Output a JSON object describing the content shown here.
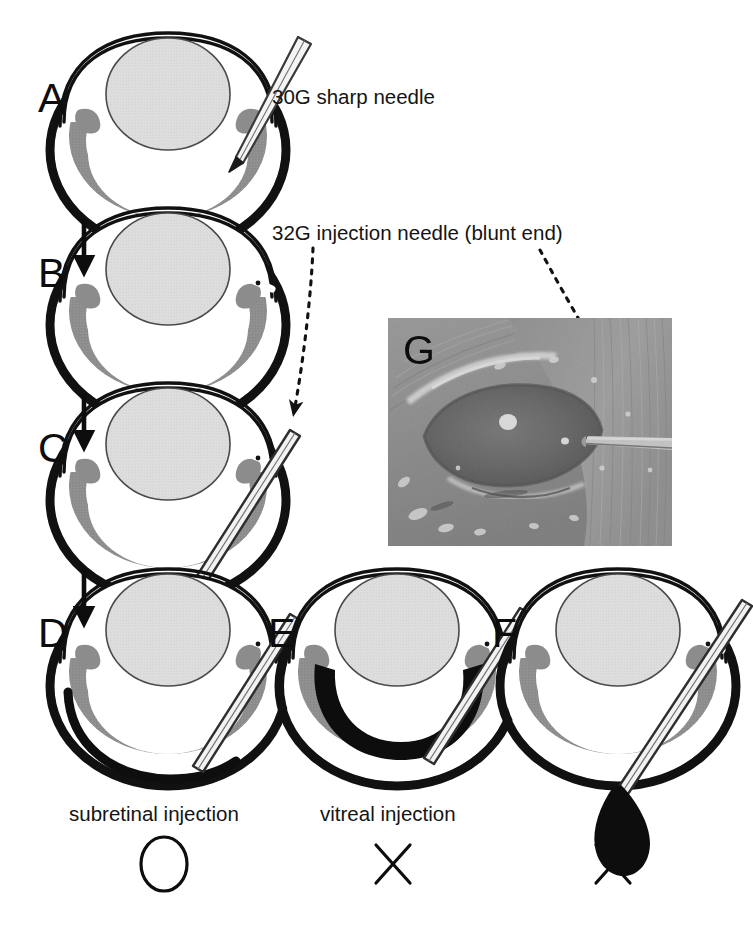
{
  "figure": {
    "background_color": "#ffffff",
    "width": 753,
    "height": 929
  },
  "colors": {
    "sclera_black": "#111111",
    "retina_gray": "#8c8c8c",
    "lens_gray": "#dcdcdc",
    "vitreous_white": "#ffffff",
    "ink_black": "#0d0d0d",
    "needle_fill": "#f2f2f2",
    "needle_stroke": "#3a3a3a",
    "photo_base": "#8a8a8a"
  },
  "panels": [
    {
      "id": "A",
      "letter": "A",
      "description": "Eye with 30G sharp needle puncturing the sclera",
      "has_needle": true,
      "needle_type": "sharp",
      "state": "puncture"
    },
    {
      "id": "B",
      "letter": "B",
      "description": "Eye after needle withdrawn showing scleral incision gap",
      "has_needle": false,
      "needle_type": "none",
      "state": "incision"
    },
    {
      "id": "C",
      "letter": "C",
      "description": "32G blunt injection needle entering through the incision",
      "has_needle": true,
      "needle_type": "blunt",
      "state": "insertion"
    },
    {
      "id": "D",
      "letter": "D",
      "description": "Correct subretinal injection, fluid between retina and sclera",
      "has_needle": true,
      "needle_type": "blunt",
      "state": "subretinal"
    },
    {
      "id": "E",
      "letter": "E",
      "description": "Incorrect vitreal injection, fluid inside the vitreous cavity",
      "has_needle": true,
      "needle_type": "blunt",
      "state": "vitreal"
    },
    {
      "id": "F",
      "letter": "F",
      "description": "Incorrect injection, fluid leaking outside the eye as a droplet",
      "has_needle": true,
      "needle_type": "blunt",
      "state": "leak"
    },
    {
      "id": "G",
      "letter": "G",
      "description": "Photograph of mouse eye with blunt needle inserted",
      "has_needle": false,
      "needle_type": "none",
      "state": "photograph"
    }
  ],
  "callouts": [
    {
      "id": "sharp-needle",
      "text": "30G sharp needle",
      "x": 272,
      "y": 86
    },
    {
      "id": "blunt-needle",
      "text": "32G injection needle (blunt end)",
      "x": 272,
      "y": 222
    }
  ],
  "captions": [
    {
      "id": "subretinal",
      "text": "subretinal injection",
      "verdict": "correct",
      "verdict_symbol": "circle",
      "x": 69,
      "y": 803
    },
    {
      "id": "vitreal",
      "text": "vitreal injection",
      "verdict": "incorrect",
      "verdict_symbol": "cross",
      "x": 320,
      "y": 803
    },
    {
      "id": "leak",
      "text": "",
      "verdict": "incorrect",
      "verdict_symbol": "cross",
      "x": 600,
      "y": 803
    }
  ],
  "verdict_marks": [
    {
      "id": "verdict-subretinal",
      "symbol": "circle",
      "cx": 164,
      "cy": 864
    },
    {
      "id": "verdict-vitreal",
      "symbol": "cross",
      "cx": 393,
      "cy": 864
    },
    {
      "id": "verdict-leak",
      "symbol": "cross",
      "cx": 613,
      "cy": 864
    }
  ],
  "flow_arrows": [
    {
      "id": "arrow-a-to-b",
      "from": "A",
      "to": "B",
      "x": 84,
      "y1": 218,
      "y2": 268
    },
    {
      "id": "arrow-b-to-c",
      "from": "B",
      "to": "C",
      "x": 84,
      "y1": 392,
      "y2": 442
    },
    {
      "id": "arrow-c-to-d",
      "from": "C",
      "to": "D",
      "x": 84,
      "y1": 568,
      "y2": 618
    }
  ],
  "leader_lines": [
    {
      "id": "leader-to-panel-c",
      "style": "dashed",
      "from_callout": "blunt-needle",
      "to_panel": "C",
      "path": "M 311,246 C 309,300 300,370 292,415"
    },
    {
      "id": "leader-to-photo-g",
      "style": "dashed",
      "from_callout": "blunt-needle",
      "to_panel": "G",
      "path": "M 542,248 C 570,300 615,380 648,430"
    }
  ],
  "photo": {
    "id": "photo-g",
    "letter": "G",
    "x": 388,
    "y": 318,
    "width": 284,
    "height": 228,
    "subject": "mouse eye with injection needle",
    "grayscale": true
  },
  "bottom_strip": {
    "text": "",
    "visible": true
  }
}
